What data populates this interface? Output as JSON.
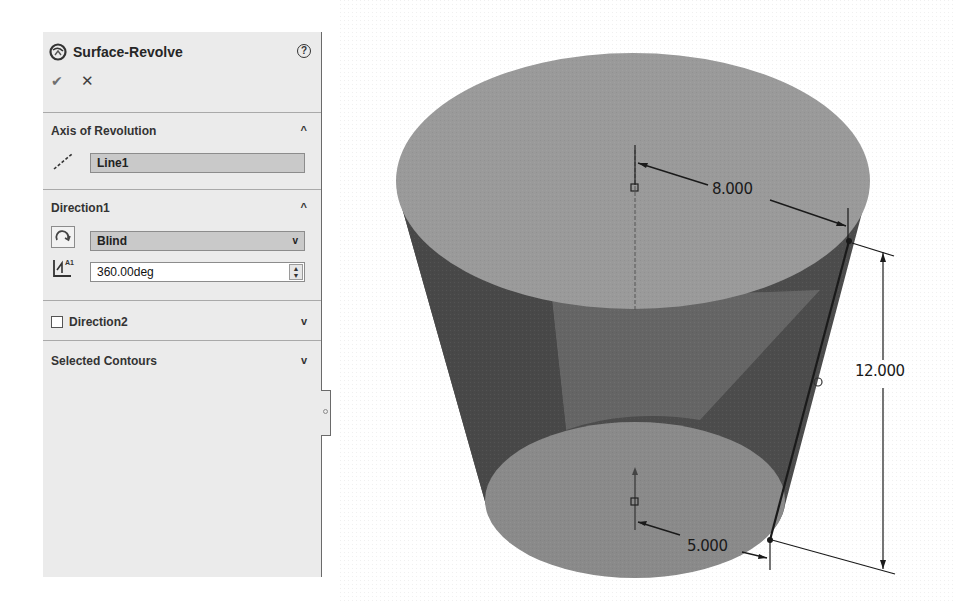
{
  "property_manager": {
    "feature_title": "Surface-Revolve",
    "feature_icon": "surface-revolve-icon",
    "help_icon": "help-icon",
    "help_glyph": "?",
    "ok_glyph": "✔",
    "cancel_glyph": "✕",
    "sections": {
      "axis_of_revolution": {
        "title": "Axis of Revolution",
        "expanded": true,
        "axis_value": "Line1",
        "icon": "axis-line-icon"
      },
      "direction1": {
        "title": "Direction1",
        "expanded": true,
        "end_condition": "Blind",
        "end_condition_icon": "reverse-direction-icon",
        "angle_value": "360.00deg",
        "angle_icon": "angle-icon"
      },
      "direction2": {
        "title": "Direction2",
        "checked": false,
        "expanded": false
      },
      "selected_contours": {
        "title": "Selected Contours",
        "expanded": false
      }
    },
    "chevron_up": "^",
    "chevron_down": "v"
  },
  "graphics_area": {
    "model": "truncated cone surface",
    "dimensions": {
      "top_radius": "8.000",
      "height": "12.000",
      "bottom_radius": "5.000"
    },
    "colors": {
      "top_face": "#9a9a9a",
      "side_dark": "#4c4c4c",
      "side_mid": "#6e6e6e",
      "bottom_face": "#8a8a8a"
    }
  }
}
